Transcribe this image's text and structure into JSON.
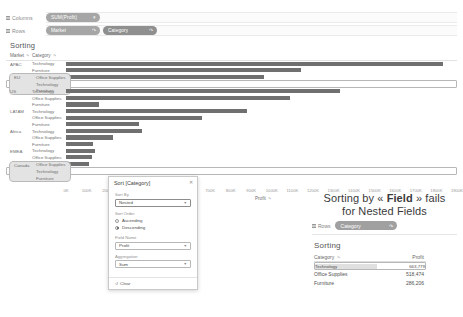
{
  "shelves": [
    {
      "label": "Columns",
      "icon": "grip-icon",
      "pills": [
        {
          "caption": "SUM(Profit)",
          "icon": "",
          "style": "dim"
        }
      ]
    },
    {
      "label": "Rows",
      "icon": "grip-icon",
      "pills": [
        {
          "caption": "Market",
          "icon": "sort-desc-icon",
          "style": "dim"
        },
        {
          "caption": "Category",
          "icon": "sort-desc-icon",
          "style": "dim2"
        }
      ]
    }
  ],
  "sheet": {
    "title": "Sorting",
    "headers": {
      "market": "Market",
      "category": "Category",
      "sort_icon": "sort-icon"
    },
    "axis": {
      "ticks": [
        "0K",
        "100K",
        "200K",
        "300K",
        "400K",
        "500K",
        "600K",
        "700K",
        "800K",
        "900K",
        "1000K",
        "1100K",
        "1200K",
        "1300K",
        "1400K",
        "1500K",
        "1600K",
        "1700K",
        "1800K",
        "1900K"
      ],
      "title": "Profit",
      "title_icon": "sort-icon",
      "max": 1900
    },
    "groups": [
      {
        "market": "APAC",
        "selected": false,
        "rows": [
          {
            "category": "Technology",
            "value": 1830
          },
          {
            "category": "Furniture",
            "value": 1140
          },
          {
            "category": "Office Supplies",
            "value": 960
          }
        ]
      },
      {
        "market": "EU",
        "selected": true,
        "rows": [
          {
            "category": "Office Supplies",
            "value": 1455
          },
          {
            "category": "Technology",
            "value": 1310
          },
          {
            "category": "Furniture",
            "value": 600
          }
        ]
      },
      {
        "market": "US",
        "selected": false,
        "rows": [
          {
            "category": "Technology",
            "value": 1330
          },
          {
            "category": "Office Supplies",
            "value": 1090
          },
          {
            "category": "Furniture",
            "value": 160
          }
        ]
      },
      {
        "market": "LATAM",
        "selected": false,
        "rows": [
          {
            "category": "Technology",
            "value": 880
          },
          {
            "category": "Office Supplies",
            "value": 660
          },
          {
            "category": "Furniture",
            "value": 355
          }
        ]
      },
      {
        "market": "Africa",
        "selected": false,
        "rows": [
          {
            "category": "Technology",
            "value": 370
          },
          {
            "category": "Office Supplies",
            "value": 230
          },
          {
            "category": "Furniture",
            "value": 130
          }
        ]
      },
      {
        "market": "EMEA",
        "selected": false,
        "rows": [
          {
            "category": "Technology",
            "value": 140
          },
          {
            "category": "Office Supplies",
            "value": 125
          },
          {
            "category": "Furniture",
            "value": 110
          }
        ]
      },
      {
        "market": "Canada",
        "selected": true,
        "rows": [
          {
            "category": "Office Supplies",
            "value": 70
          },
          {
            "category": "Technology",
            "value": 55
          },
          {
            "category": "Furniture",
            "value": 40
          }
        ]
      }
    ]
  },
  "dialog": {
    "title": "Sort [Category]",
    "close_icon": "close-icon",
    "sort_by": {
      "label": "Sort By",
      "value": "Nested",
      "caret": "chevron-down-icon"
    },
    "sort_order": {
      "label": "Sort Order",
      "options": [
        {
          "label": "Ascending",
          "selected": false
        },
        {
          "label": "Descending",
          "selected": true
        }
      ]
    },
    "field_name": {
      "label": "Field Name",
      "value": "Profit",
      "caret": "chevron-down-icon"
    },
    "aggregation": {
      "label": "Aggregation",
      "value": "Sum",
      "caret": "chevron-down-icon"
    },
    "clear": {
      "label": "Clear",
      "icon": "clear-icon"
    }
  },
  "note": {
    "heading_pre": "Sorting by « ",
    "heading_bold": "Field",
    "heading_post": " » fails",
    "heading_line2": "for Nested Fields",
    "rows_shelf": {
      "label": "Rows",
      "icon": "grip-icon",
      "pill": "Category",
      "pill_icon": "sort-desc-icon"
    },
    "title": "Sorting",
    "table": {
      "columns": [
        "Category",
        "Profit"
      ],
      "sort_icon": "sort-icon",
      "rows": [
        {
          "category": "Technology",
          "profit": "663,779",
          "selected": true
        },
        {
          "category": "Office Supplies",
          "profit": "518,474",
          "selected": false
        },
        {
          "category": "Furniture",
          "profit": "286,206",
          "selected": false
        }
      ]
    }
  },
  "colors": {
    "bar": "#707070",
    "pill": "#a6a6a6",
    "selection": "#e3e3e3"
  }
}
